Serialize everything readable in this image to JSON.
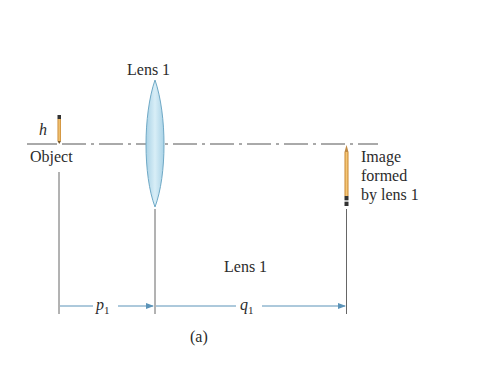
{
  "figure": {
    "label": "(a)",
    "lens": {
      "title": "Lens 1",
      "bottom_label": "Lens 1"
    },
    "object": {
      "label": "Object",
      "height_symbol": "h"
    },
    "image": {
      "line1": "Image",
      "line2": "formed",
      "line3": "by lens 1"
    },
    "distances": {
      "p": {
        "symbol": "p",
        "subscript": "1"
      },
      "q": {
        "symbol": "q",
        "subscript": "1"
      }
    }
  },
  "colors": {
    "lens_fill": "#b9dcea",
    "lens_edge": "#6fa9c6",
    "arrow": "#5b93b8",
    "pencil": "#e2a64a",
    "line": "#555555"
  }
}
